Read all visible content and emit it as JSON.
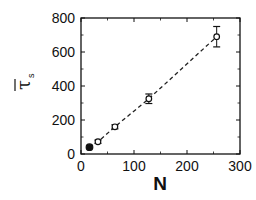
{
  "chart_data": {
    "type": "scatter",
    "title": "",
    "xlabel": "N",
    "ylabel": "τ̄_s",
    "ylabel_symbol": "τ",
    "ylabel_subscript": "s",
    "xlim": [
      0,
      300
    ],
    "ylim": [
      0,
      800
    ],
    "xticks": [
      0,
      100,
      200,
      300
    ],
    "yticks": [
      0,
      200,
      400,
      600,
      800
    ],
    "x_minor_ticks": [
      50,
      150,
      250
    ],
    "y_minor_ticks": [
      100,
      300,
      500,
      700
    ],
    "grid": false,
    "legend": null,
    "series": [
      {
        "name": "tau_s",
        "marker": "open-circle",
        "line": "dashed",
        "color": "#111111",
        "points": [
          {
            "x": 16,
            "y": 40,
            "err": 5,
            "filled": true
          },
          {
            "x": 32,
            "y": 72,
            "err": 10,
            "filled": false
          },
          {
            "x": 64,
            "y": 160,
            "err": 12,
            "filled": false
          },
          {
            "x": 128,
            "y": 325,
            "err": 28,
            "filled": false
          },
          {
            "x": 256,
            "y": 690,
            "err": 60,
            "filled": false
          }
        ]
      }
    ],
    "plot_box_px": {
      "left": 81,
      "right": 240,
      "top": 18,
      "bottom": 154
    }
  }
}
